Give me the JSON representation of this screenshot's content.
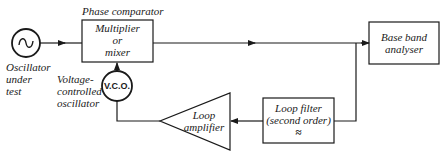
{
  "diagram": {
    "phase_comparator_label": "Phase comparator",
    "oscillator": {
      "symbol": "~",
      "label_lines": [
        "Oscillator",
        "under",
        "test"
      ]
    },
    "mixer": {
      "label_lines": [
        "Multiplier",
        "or",
        "mixer"
      ]
    },
    "vco": {
      "symbol": "V.C.O.",
      "label_lines": [
        "Voltage-",
        "controlled",
        "oscillator"
      ]
    },
    "base_band": {
      "label_lines": [
        "Base band",
        "analyser"
      ]
    },
    "loop_filter": {
      "label_lines": [
        "Loop filter",
        "(second order)"
      ],
      "symbol": "≈"
    },
    "loop_amplifier": {
      "label_lines": [
        "Loop",
        "amplifier"
      ]
    },
    "stroke_color": "#1a1a1a"
  }
}
